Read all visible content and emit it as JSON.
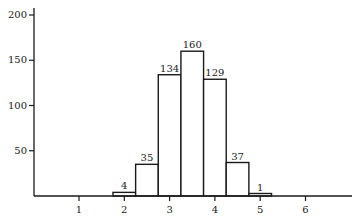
{
  "chart_data": {
    "type": "bar",
    "subtype": "histogram",
    "title": "",
    "xlabel": "",
    "ylabel": "",
    "bins": [
      {
        "start": 1.75,
        "end": 2.25,
        "value": 4
      },
      {
        "start": 2.25,
        "end": 2.75,
        "value": 35
      },
      {
        "start": 2.75,
        "end": 3.25,
        "value": 134
      },
      {
        "start": 3.25,
        "end": 3.75,
        "value": 160
      },
      {
        "start": 3.75,
        "end": 4.25,
        "value": 129
      },
      {
        "start": 4.25,
        "end": 4.75,
        "value": 37
      },
      {
        "start": 4.75,
        "end": 5.25,
        "value": 1
      }
    ],
    "categories": [
      "1.75-2.25",
      "2.25-2.75",
      "2.75-3.25",
      "3.25-3.75",
      "3.75-4.25",
      "4.25-4.75",
      "4.75-5.25"
    ],
    "values": [
      4,
      35,
      134,
      160,
      129,
      37,
      1
    ],
    "data_labels": [
      "4",
      "35",
      "134",
      "160",
      "129",
      "37",
      "1"
    ],
    "x_ticks": [
      1,
      2,
      3,
      4,
      5,
      6
    ],
    "x_tick_labels": [
      "1",
      "2",
      "3",
      "4",
      "5",
      "6"
    ],
    "y_ticks": [
      50,
      100,
      150,
      200
    ],
    "y_tick_labels": [
      "50",
      "100",
      "150",
      "200"
    ],
    "xlim": [
      0.0,
      7.0
    ],
    "ylim": [
      0,
      210
    ],
    "grid": false,
    "legend": null,
    "colors": {
      "bar_fill": "#ffffff",
      "bar_stroke": "#1a1a1a",
      "axis": "#1a1a1a"
    }
  }
}
